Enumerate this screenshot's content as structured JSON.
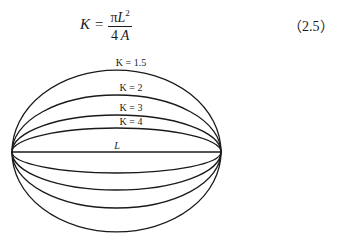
{
  "equation": {
    "lhs": "K",
    "equals": "=",
    "numerator_pi": "π",
    "numerator_var": "L",
    "numerator_exp": "2",
    "denominator_num": "4",
    "denominator_var": "A",
    "number": "（2.5）"
  },
  "diagram": {
    "baseline_label": "L",
    "curves": [
      {
        "label": "K = 1.5",
        "height_above": 82,
        "height_below": 80
      },
      {
        "label": "K = 2",
        "height_above": 57,
        "height_below": 56
      },
      {
        "label": "K = 3",
        "height_above": 37,
        "height_below": 38
      },
      {
        "label": "K = 4",
        "height_above": 24,
        "height_below": 21
      }
    ],
    "stroke_color": "#1a1a1a"
  }
}
